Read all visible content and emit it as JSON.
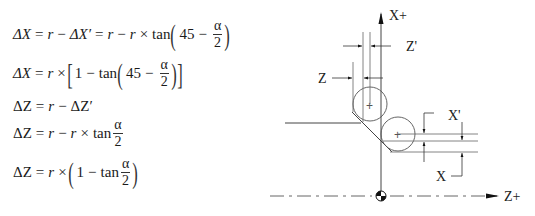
{
  "equations": [
    {
      "id": "eq1",
      "lhs": "ΔX",
      "parts": [
        "=",
        "r",
        "−",
        "ΔX′",
        "=",
        "r",
        "−",
        "r",
        "×",
        "tan",
        "(",
        "45",
        "−",
        "α/2",
        ")"
      ],
      "text": "ΔX = r − ΔX′ = r − r × tan(45 − α/2)"
    },
    {
      "id": "eq2",
      "lhs": "ΔX",
      "parts": [
        "=",
        "r",
        "×",
        "[",
        "1",
        "−",
        "tan",
        "(",
        "45",
        "−",
        "α/2",
        ")",
        "]"
      ],
      "text": "ΔX = r × [1 − tan(45 − α/2)]"
    },
    {
      "id": "eq3",
      "lhs": "ΔZ",
      "parts": [
        "=",
        "r",
        "−",
        "ΔZ′"
      ],
      "text": "ΔZ = r − ΔZ′"
    },
    {
      "id": "eq4",
      "lhs": "ΔZ",
      "parts": [
        "=",
        "r",
        "−",
        "r",
        "×",
        "tan",
        "α/2"
      ],
      "text": "ΔZ = r − r × tan α/2"
    },
    {
      "id": "eq5",
      "lhs": "ΔZ",
      "parts": [
        "=",
        "r",
        "×",
        "(",
        "1",
        "−",
        "tan",
        "α/2",
        ")"
      ],
      "text": "ΔZ = r × (1 − tan α/2)"
    }
  ],
  "symbols": {
    "delta_x": "ΔX",
    "delta_x_prime": "ΔX′",
    "delta_z": "ΔZ",
    "delta_z_prime": "ΔZ′",
    "r": "r",
    "eq": "=",
    "minus": "−",
    "times": "×",
    "tan": "tan",
    "one": "1",
    "forty_five": "45",
    "alpha": "α",
    "two": "2"
  },
  "diagram": {
    "axis_x_label": "X+",
    "axis_z_label": "Z+",
    "dim_z_label": "Z",
    "dim_z_prime_label": "Z'",
    "dim_x_label": "X",
    "dim_x_prime_label": "X'",
    "center_mark": "+"
  }
}
